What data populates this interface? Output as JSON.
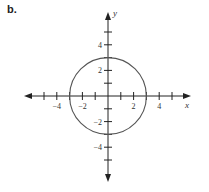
{
  "panel_label": "b.",
  "chart_data": {
    "type": "line",
    "title": "",
    "xlabel": "x",
    "ylabel": "y",
    "xlim": [
      -6,
      6
    ],
    "ylim": [
      -6,
      6
    ],
    "grid": false,
    "x_ticks": [
      -5,
      -4,
      -3,
      -2,
      -1,
      1,
      2,
      3,
      4,
      5
    ],
    "y_ticks": [
      -5,
      -4,
      -3,
      -2,
      -1,
      1,
      2,
      3,
      4,
      5
    ],
    "x_tick_labels": [
      "-4",
      "-2",
      "2",
      "4"
    ],
    "y_tick_labels": [
      "4",
      "2",
      "-2",
      "-4"
    ],
    "series": [
      {
        "name": "circle x^2 + y^2 = 9",
        "shape": "circle",
        "center": [
          0,
          0
        ],
        "radius": 3
      }
    ],
    "colors": {
      "axis": "#222222",
      "curve": "#555555"
    }
  }
}
